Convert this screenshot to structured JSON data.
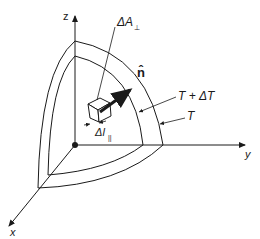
{
  "diagram": {
    "axes": {
      "z_label": "z",
      "y_label": "y",
      "x_label": "x"
    },
    "labels": {
      "area": "ΔA",
      "area_sub": "⊥",
      "normal": "n̂",
      "outer_surface": "T + ΔT",
      "inner_surface": "T",
      "length": "Δl",
      "length_sub": "||"
    },
    "colors": {
      "stroke": "#1a1a1a",
      "background": "#ffffff"
    }
  }
}
